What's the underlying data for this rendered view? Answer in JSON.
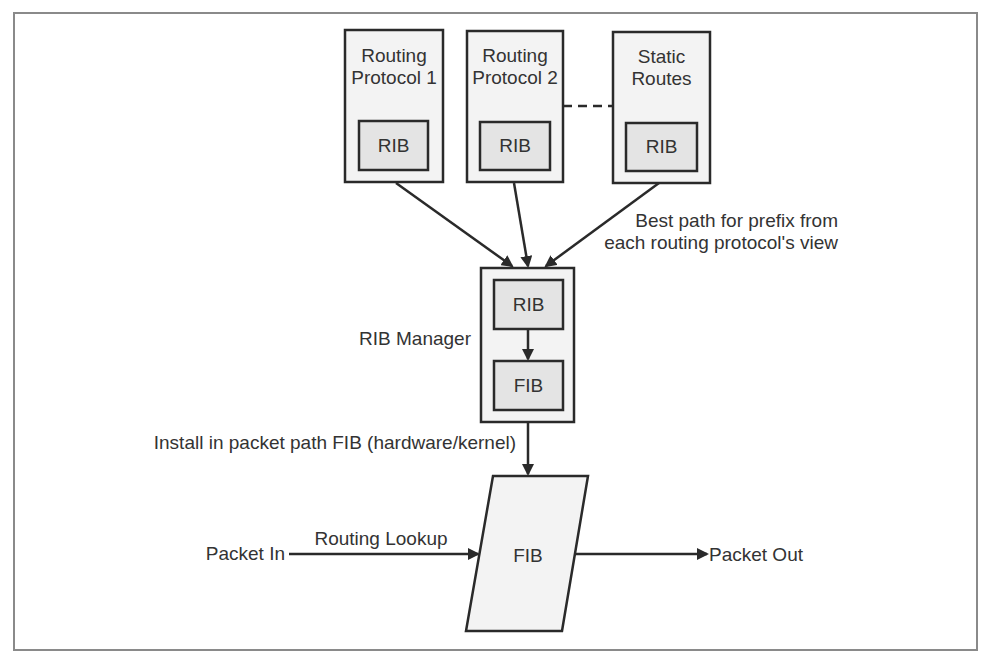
{
  "diagram": {
    "type": "routing-architecture-flow",
    "colors": {
      "stroke": "#2a2a2a",
      "text": "#333333",
      "outer_fill": "#f3f3f3",
      "inner_fill": "#e4e4e4",
      "frame": "#8a8a8a",
      "background": "#ffffff"
    },
    "sources": [
      {
        "id": "rp1",
        "title_line1": "Routing",
        "title_line2": "Protocol 1",
        "inner_label": "RIB"
      },
      {
        "id": "rp2",
        "title_line1": "Routing",
        "title_line2": "Protocol 2",
        "inner_label": "RIB"
      },
      {
        "id": "static",
        "title_line1": "Static",
        "title_line2": "Routes",
        "inner_label": "RIB"
      }
    ],
    "source_link_style": "dashed",
    "best_path_note": {
      "line1": "Best path for prefix from",
      "line2": "each routing protocol's view"
    },
    "rib_manager": {
      "label": "RIB Manager",
      "inner_top": "RIB",
      "inner_bottom": "FIB"
    },
    "install_note": "Install in packet path FIB (hardware/kernel)",
    "packet_fib": {
      "label": "FIB"
    },
    "packet_in": "Packet In",
    "routing_lookup": "Routing Lookup",
    "packet_out": "Packet Out",
    "edges": [
      {
        "from": "rp1",
        "to": "rib_manager"
      },
      {
        "from": "rp2",
        "to": "rib_manager"
      },
      {
        "from": "static",
        "to": "rib_manager"
      },
      {
        "from": "rib_manager.rib",
        "to": "rib_manager.fib"
      },
      {
        "from": "rib_manager",
        "to": "packet_fib"
      },
      {
        "from": "packet_in",
        "to": "packet_fib"
      },
      {
        "from": "packet_fib",
        "to": "packet_out"
      }
    ]
  }
}
